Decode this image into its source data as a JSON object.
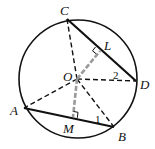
{
  "diagram": {
    "type": "circle-geometry",
    "colors": {
      "line": "#111111",
      "perpendicular": "#9a9a9a",
      "background": "#ffffff"
    },
    "points": {
      "O": {
        "label": "O"
      },
      "A": {
        "label": "A"
      },
      "B": {
        "label": "B"
      },
      "C": {
        "label": "C"
      },
      "D": {
        "label": "D"
      },
      "L": {
        "label": "L"
      },
      "M": {
        "label": "M"
      }
    },
    "angles": {
      "angle1": {
        "label": "1"
      },
      "angle2": {
        "label": "2"
      }
    },
    "segments": {
      "solid": [
        "AB",
        "CD"
      ],
      "dashed": [
        "OA",
        "OB",
        "OC",
        "OD"
      ],
      "gray_dashed": [
        "OL",
        "OM"
      ]
    },
    "right_angle_marks": [
      "L",
      "M"
    ]
  }
}
